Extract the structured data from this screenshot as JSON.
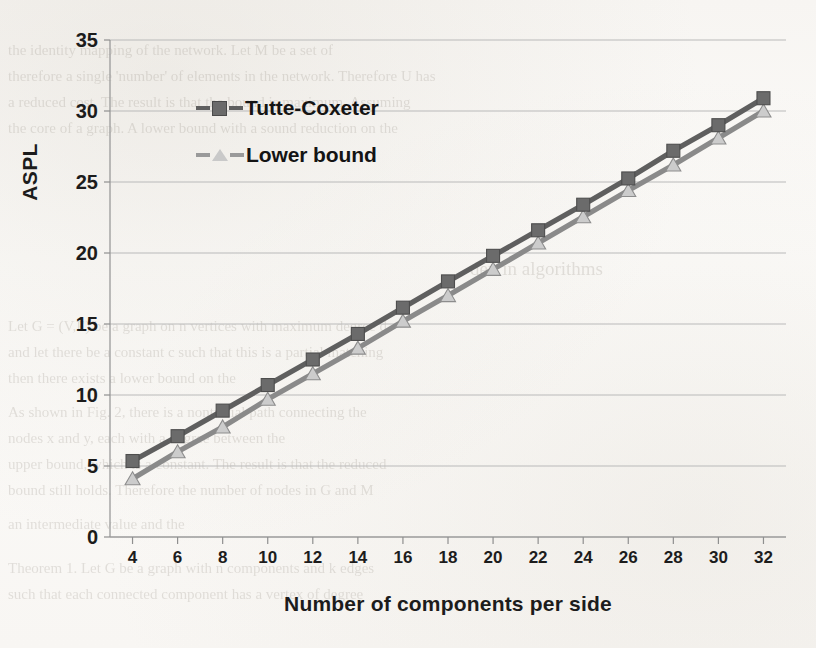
{
  "chart_data": {
    "type": "line",
    "title": "",
    "xlabel": "Number of components per side",
    "ylabel": "ASPL",
    "x": [
      4,
      6,
      8,
      10,
      12,
      14,
      16,
      18,
      20,
      22,
      24,
      26,
      28,
      30,
      32
    ],
    "xlim": [
      3,
      33
    ],
    "ylim": [
      0,
      35
    ],
    "xtick_labels": [
      "4",
      "6",
      "8",
      "10",
      "12",
      "14",
      "16",
      "18",
      "20",
      "22",
      "24",
      "26",
      "28",
      "30",
      "32"
    ],
    "ytick_labels": [
      "0",
      "5",
      "10",
      "15",
      "20",
      "25",
      "30",
      "35"
    ],
    "yticks": [
      0,
      5,
      10,
      15,
      20,
      25,
      30,
      35
    ],
    "grid": "horizontal",
    "legend_position": "upper-left-inside",
    "series": [
      {
        "name": "Tutte-Coxeter",
        "marker": "square",
        "color": "#5f5f5f",
        "marker_color": "#6b6b6b",
        "values": [
          5.35,
          7.1,
          8.9,
          10.7,
          12.5,
          14.3,
          16.15,
          18.0,
          19.8,
          21.6,
          23.4,
          25.25,
          27.2,
          29.0,
          30.9
        ]
      },
      {
        "name": "Lower bound",
        "marker": "triangle",
        "color": "#8a8a8a",
        "marker_color": "#cccccc",
        "values": [
          4.1,
          6.0,
          7.75,
          9.7,
          11.5,
          13.3,
          15.2,
          17.0,
          18.85,
          20.7,
          22.55,
          24.4,
          26.2,
          28.1,
          30.0
        ]
      }
    ]
  },
  "legend": {
    "items": [
      {
        "label": "Tutte-Coxeter"
      },
      {
        "label": "Lower bound"
      }
    ]
  },
  "bleed_through": {
    "lines": [
      "the identity mapping of the network. Let M be a set of",
      "therefore a single 'number' of elements in the network. Therefore U has",
      "a reduced cost. The result is that the bound is maximum. Assuming",
      "the core of a graph. A lower bound with a sound reduction on the",
      "dex  in algorithms",
      "Let  G = (V,E) be a graph on n vertices with maximum degree d,",
      "and let there be a constant c such that this is a partial matching",
      "then there exists a lower bound on the",
      "As  shown in  Fig. 2, there is a nontrivial path connecting the",
      "nodes x and y,  each with a degree between the",
      "upper bound, which is a constant. The result is that the reduced",
      "bound still  holds. Therefore the number of nodes in G and M",
      "an  intermediate  value and the",
      "Theorem  1. Let G be a graph with n components and k edges",
      "such that each connected component has a vertex of degree"
    ]
  }
}
